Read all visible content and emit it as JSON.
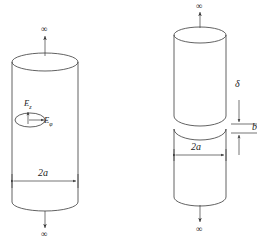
{
  "figure": {
    "type": "technical-line-diagram",
    "stroke_color": "#333333",
    "background_color": "#ffffff",
    "panels": [
      {
        "id": "left-panel",
        "name": "continuous-cylinder",
        "labels": {
          "top_infinity": "∞",
          "bottom_infinity": "∞",
          "diameter": "2a",
          "field_axial": "E",
          "field_axial_sub": "z",
          "field_azimuthal": "E",
          "field_azimuthal_sub": "φ"
        }
      },
      {
        "id": "right-panel",
        "name": "gapped-cylinder",
        "labels": {
          "top_infinity": "∞",
          "bottom_infinity": "∞",
          "diameter": "2a",
          "gap": "δ",
          "edge_mark": "b"
        }
      }
    ]
  }
}
